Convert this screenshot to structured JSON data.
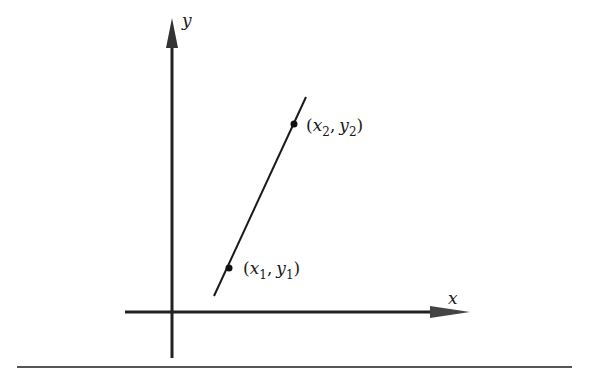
{
  "figure": {
    "axes": {
      "x_label": "x",
      "y_label": "y"
    },
    "points": [
      {
        "name": "point-1",
        "label_open": "(",
        "x_var": "x",
        "x_sub": "1",
        "comma": ",",
        "y_var": "y",
        "y_sub": "1",
        "label_close": ")"
      },
      {
        "name": "point-2",
        "label_open": "(",
        "x_var": "x",
        "x_sub": "2",
        "comma": ",",
        "y_var": "y",
        "y_sub": "2",
        "label_close": ")"
      }
    ],
    "colors": {
      "ink": "#1a1a1a",
      "axis": "#222222",
      "rule": "#555555"
    }
  }
}
